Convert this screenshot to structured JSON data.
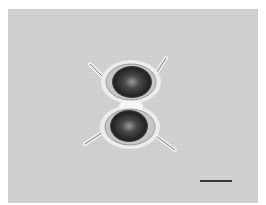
{
  "image": {
    "subject": "desmid cell (two semicells with arm processes), light micrograph",
    "background_color": "#d2d2d2",
    "border_color": "#ffffff",
    "cell_dark_color": "#2a2a2a",
    "halo_color": "#f2f2f2"
  },
  "scale_bar": {
    "label": ""
  }
}
